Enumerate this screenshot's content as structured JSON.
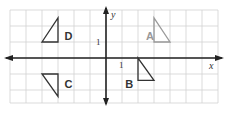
{
  "diagram": {
    "type": "coordinate-grid",
    "grid": {
      "x_min": -6,
      "x_max": 7,
      "y_min": -3,
      "y_max": 3,
      "unit_px": 16,
      "origin_px": [
        106,
        58
      ],
      "line_color": "#d2d2d2"
    },
    "axes": {
      "x_label": "x",
      "y_label": "y",
      "x_tick_label": "1",
      "y_tick_label": "1",
      "color": "#222222"
    },
    "triangles": [
      {
        "id": "A",
        "label": "A",
        "color": "#999999",
        "vertices": [
          [
            3,
            2.5
          ],
          [
            3,
            1
          ],
          [
            4,
            1
          ]
        ],
        "label_pos": [
          2.5,
          1.4
        ]
      },
      {
        "id": "B",
        "label": "B",
        "color": "#333333",
        "vertices": [
          [
            2,
            0
          ],
          [
            2,
            -1.4
          ],
          [
            3,
            -1.4
          ]
        ],
        "label_pos": [
          1.2,
          -1.6
        ]
      },
      {
        "id": "C",
        "label": "C",
        "color": "#333333",
        "vertices": [
          [
            -4,
            -1
          ],
          [
            -3,
            -1
          ],
          [
            -3,
            -2.4
          ]
        ],
        "label_pos": [
          -2.6,
          -1.6
        ]
      },
      {
        "id": "D",
        "label": "D",
        "color": "#333333",
        "vertices": [
          [
            -3,
            2.5
          ],
          [
            -3,
            1
          ],
          [
            -4,
            1
          ]
        ],
        "label_pos": [
          -2.6,
          1.4
        ]
      }
    ]
  }
}
